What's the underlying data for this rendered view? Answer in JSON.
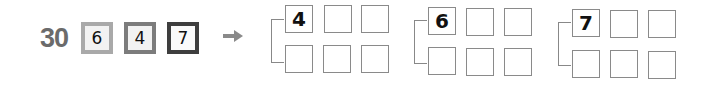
{
  "problem": {
    "total": "30",
    "cards": [
      {
        "value": "6",
        "border_color": "#a9a9a9"
      },
      {
        "value": "4",
        "border_color": "#7c7c7c"
      },
      {
        "value": "7",
        "border_color": "#3e3e3e"
      }
    ],
    "arrow_icon": "right-arrow-icon"
  },
  "groups": [
    {
      "first_digit": "4",
      "rows": [
        [
          "4",
          "",
          ""
        ],
        [
          "",
          "",
          ""
        ]
      ]
    },
    {
      "first_digit": "6",
      "rows": [
        [
          "6",
          "",
          ""
        ],
        [
          "",
          "",
          ""
        ]
      ]
    },
    {
      "first_digit": "7",
      "rows": [
        [
          "7",
          "",
          ""
        ],
        [
          "",
          "",
          ""
        ]
      ]
    }
  ]
}
